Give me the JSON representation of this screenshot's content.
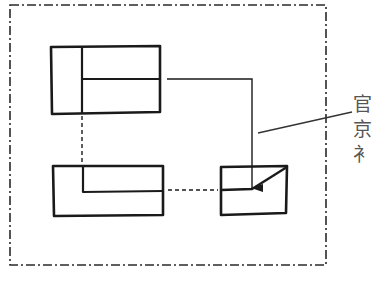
{
  "diagram": {
    "type": "orthographic-projection-views",
    "colors": {
      "stroke": "#1a1a1a",
      "frame": "#2a2a2a",
      "text": "#555555",
      "background": "#ffffff"
    },
    "frame": {
      "style": "dash-dot",
      "x": 10,
      "y": 5,
      "width": 316,
      "height": 260
    },
    "views": [
      {
        "id": "front-view",
        "position": "top-left"
      },
      {
        "id": "top-view",
        "position": "bottom-left"
      },
      {
        "id": "auxiliary-view",
        "position": "bottom-right"
      }
    ],
    "projection_lines": [
      {
        "style": "dashed",
        "from": "front-view",
        "to": "top-view"
      },
      {
        "style": "dashed",
        "from": "top-view",
        "to": "auxiliary-view"
      }
    ],
    "arrow": {
      "from": "front-view",
      "to": "auxiliary-view"
    },
    "annotation": {
      "lines": [
        "官",
        "京",
        "衤"
      ]
    }
  }
}
